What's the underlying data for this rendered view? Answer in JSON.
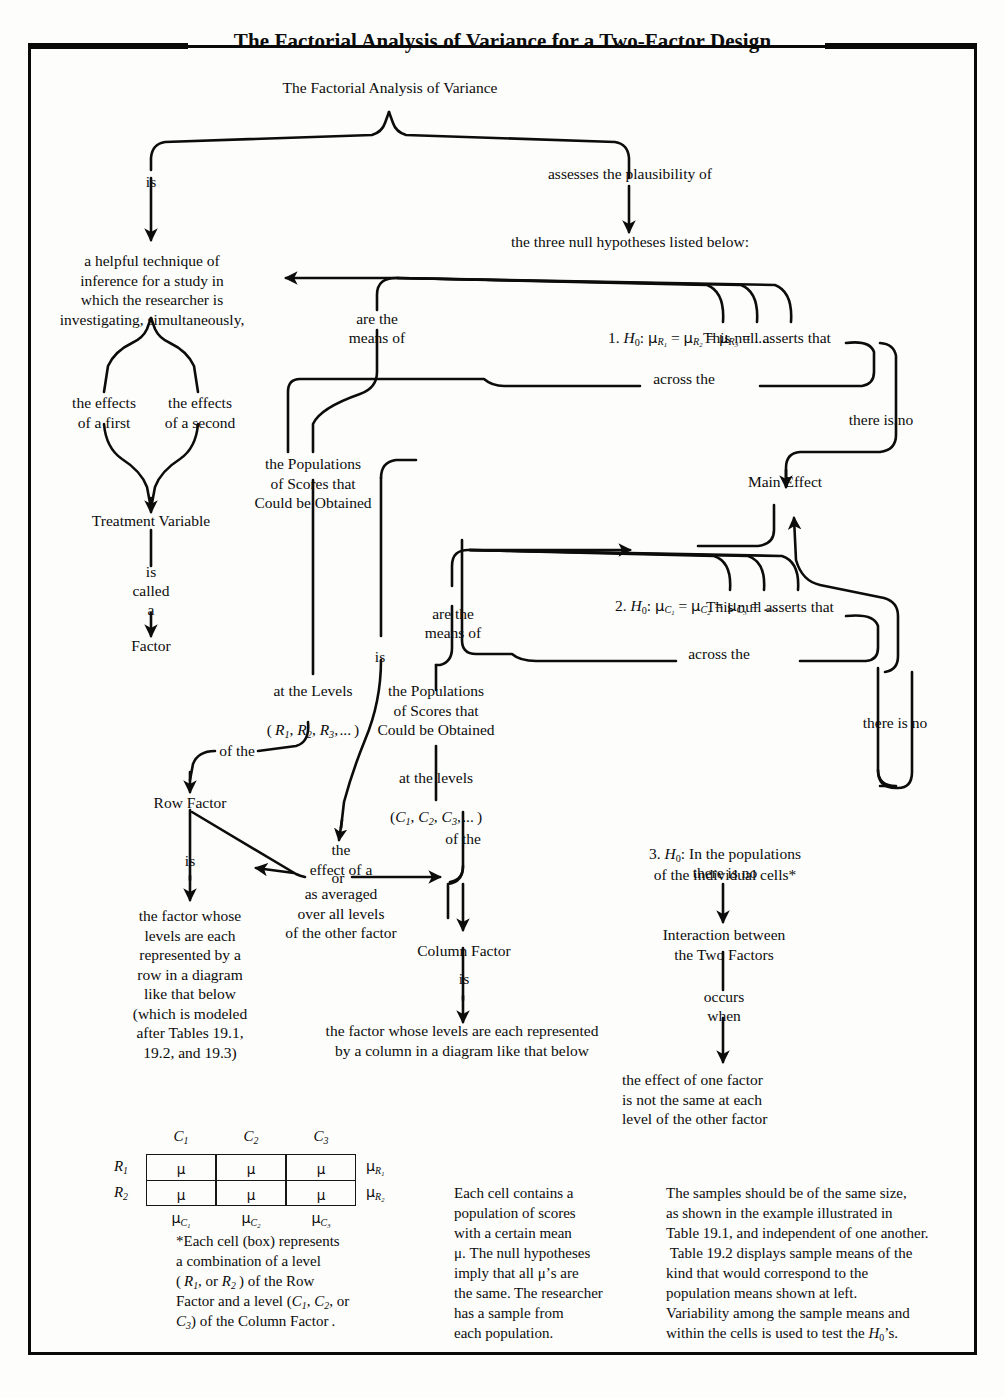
{
  "title": "The Factorial Analysis of Variance for a Two-Factor Design",
  "root": {
    "label": "The Factorial Analysis of Variance"
  },
  "branch_labels": {
    "is": "is",
    "assesses": "assesses the plausibility of",
    "are_the_means_of_1": "are the\nmeans of",
    "are_the_means_of_2": "are the\nmeans of",
    "across_the_1": "across the",
    "across_the_2": "across the",
    "there_is_no_1": "there is no",
    "there_is_no_2": "there is no",
    "is_called_a": "is\ncalled\na",
    "is_row": "is",
    "is_center": "is",
    "is_column": "is",
    "of_the_row": "of the",
    "of_the_column": "of the",
    "occurs_when": "occurs\nwhen"
  },
  "nodes": {
    "helpful_technique": "a helpful technique of\ninference for a study in\nwhich the researcher is\ninvestigating, simultaneously,",
    "effects_first": "the effects\nof a first",
    "effects_second": "the effects\nof a second",
    "treatment_variable": "Treatment Variable",
    "factor": "Factor",
    "three_nulls": "the three null hypotheses listed below:",
    "populations_rows": "the Populations\nof Scores that\nCould be Obtained",
    "populations_cols": "the Populations\nof Scores that\nCould be Obtained",
    "at_the_levels_R": "at the Levels",
    "at_the_levels_C": "at the levels",
    "row_factor": "Row Factor",
    "column_factor": "Column Factor",
    "main_effect": "Main Effect",
    "effect_of_a": "the\neffect of a",
    "or": "or",
    "as_averaged": "as averaged\nover all levels\nof the other factor",
    "row_factor_def": "the factor whose\nlevels are each\nrepresented by a\nrow in a diagram\nlike that below\n(which is modeled\nafter Tables 19.1,\n19.2, and 19.3)",
    "column_factor_def": "the factor whose levels are each represented\nby a column in a diagram like that below",
    "interaction": "Interaction between\nthe Two Factors",
    "effect_one_factor": "the effect of one factor\nis not the same at each\nlevel of the other factor",
    "this_null_asserts_1": "This null asserts that",
    "this_null_asserts_2": "This null asserts that",
    "h3_there_is_no": "there is no"
  },
  "hypotheses": {
    "h1_prefix": "1. ",
    "h1_formula": "H0:  μR1 = μR2 = μR3 = ....",
    "h2_prefix": "2. ",
    "h2_formula": "H0:  μC1 = μC2 = μC3 = ....",
    "h3_prefix": "3. ",
    "h3_text": "H0: In the populations\nof the individual cells*"
  },
  "levels": {
    "rows": "( R1, R2, R3, ... )",
    "cols": "( C1, C2, C3, ... )"
  },
  "table": {
    "col_headers": [
      "C1",
      "C2",
      "C3"
    ],
    "row_headers": [
      "R1",
      "R2"
    ],
    "cells": [
      [
        "μ",
        "μ",
        "μ"
      ],
      [
        "μ",
        "μ",
        "μ"
      ]
    ],
    "row_margins": [
      "μR1",
      "μR2"
    ],
    "col_margins": [
      "μC1",
      "μC2",
      "μC3"
    ]
  },
  "footnotes": {
    "star_note": "*Each cell (box) represents\na combination of a level\n( R1, or R2 ) of the Row\nFactor and a level (C1, C2, or\nC3) of the Column Factor .",
    "middle_note": "Each cell contains a\npopulation of scores\nwith a certain mean\nμ. The null hypotheses\nimply that all μ’s are\nthe same. The researcher\nhas a sample from\neach population.",
    "right_note": "The samples should be of the same size,\nas shown in the example illustrated in\nTable 19.1, and independent of one another.\nTable 19.2 displays sample means of the\nkind that would correspond to the\npopulation means shown at left.\nVariability among the sample means and\nwithin the cells is used to test the H0’s."
  },
  "colors": {
    "ink": "#0c0c0c",
    "paper": "#fdfdfb",
    "rule": "#0a0a0a"
  }
}
